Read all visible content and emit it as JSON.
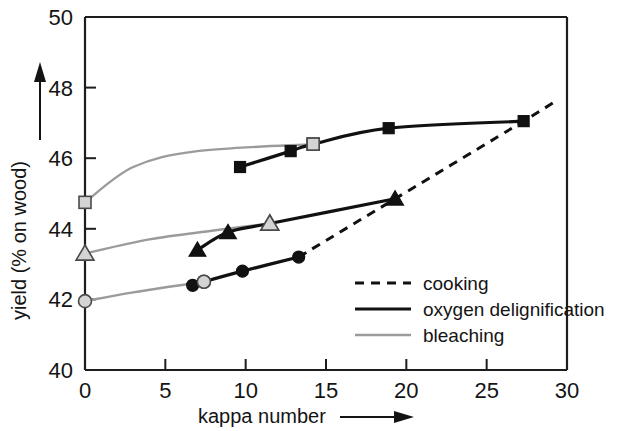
{
  "chart_data": {
    "type": "line",
    "title": "",
    "xlabel": "kappa number",
    "ylabel": "yield (% on wood)",
    "xlim": [
      0,
      30
    ],
    "ylim": [
      40,
      50
    ],
    "xticks": [
      0,
      5,
      10,
      15,
      20,
      25,
      30
    ],
    "yticks": [
      40,
      42,
      44,
      46,
      48,
      50
    ],
    "xtick_labels": [
      "0",
      "5",
      "10",
      "15",
      "20",
      "25",
      "30"
    ],
    "ytick_labels": [
      "40",
      "42",
      "44",
      "46",
      "48",
      "50"
    ],
    "grid": false,
    "legend_position": "inside lower right",
    "series": [
      {
        "name": "cooking",
        "style": "dashed",
        "color": "#111111",
        "points": [
          {
            "x": 13.3,
            "y": 43.2
          },
          {
            "x": 19.3,
            "y": 44.85
          },
          {
            "x": 27.3,
            "y": 47.05
          },
          {
            "x": 29.4,
            "y": 47.65
          }
        ]
      },
      {
        "name": "oxygen delignification",
        "style": "solid",
        "color": "#111111",
        "branches": [
          {
            "label": "upper-squares",
            "marker": "square",
            "points": [
              {
                "x": 9.65,
                "y": 45.75,
                "marker": "filled-square"
              },
              {
                "x": 12.8,
                "y": 46.2,
                "marker": "filled-square"
              },
              {
                "x": 14.2,
                "y": 46.4,
                "marker": "open-square"
              },
              {
                "x": 18.9,
                "y": 46.85,
                "marker": "filled-square"
              },
              {
                "x": 27.3,
                "y": 47.05,
                "marker": "filled-square"
              }
            ]
          },
          {
            "label": "middle-triangles",
            "marker": "triangle",
            "points": [
              {
                "x": 7.0,
                "y": 43.4,
                "marker": "filled-triangle"
              },
              {
                "x": 8.9,
                "y": 43.9,
                "marker": "filled-triangle"
              },
              {
                "x": 11.5,
                "y": 44.15,
                "marker": "open-triangle"
              },
              {
                "x": 19.3,
                "y": 44.85,
                "marker": "filled-triangle"
              }
            ]
          },
          {
            "label": "lower-circles",
            "marker": "circle",
            "points": [
              {
                "x": 6.7,
                "y": 42.4,
                "marker": "filled-circle"
              },
              {
                "x": 7.4,
                "y": 42.5,
                "marker": "open-circle"
              },
              {
                "x": 9.8,
                "y": 42.8,
                "marker": "filled-circle"
              },
              {
                "x": 13.3,
                "y": 43.2,
                "marker": "filled-circle"
              }
            ]
          }
        ]
      },
      {
        "name": "bleaching",
        "style": "solid",
        "color": "#9b9b9b",
        "branches": [
          {
            "label": "upper-squares",
            "points": [
              {
                "x": 0.0,
                "y": 44.75,
                "marker": "open-square"
              },
              {
                "x": 3.0,
                "y": 45.75
              },
              {
                "x": 7.0,
                "y": 46.2
              },
              {
                "x": 14.2,
                "y": 46.4,
                "marker": "open-square"
              }
            ]
          },
          {
            "label": "middle-triangles",
            "points": [
              {
                "x": 0.0,
                "y": 43.3,
                "marker": "open-triangle"
              },
              {
                "x": 4.0,
                "y": 43.7
              },
              {
                "x": 8.0,
                "y": 43.95
              },
              {
                "x": 11.5,
                "y": 44.15,
                "marker": "open-triangle"
              }
            ]
          },
          {
            "label": "lower-circles",
            "points": [
              {
                "x": 0.0,
                "y": 41.95,
                "marker": "open-circle"
              },
              {
                "x": 3.0,
                "y": 42.2
              },
              {
                "x": 7.4,
                "y": 42.5,
                "marker": "open-circle"
              }
            ]
          }
        ]
      }
    ],
    "legend": [
      {
        "label": "cooking",
        "style": "dashed",
        "color": "#111111"
      },
      {
        "label": "oxygen delignification",
        "style": "solid",
        "color": "#111111"
      },
      {
        "label": "bleaching",
        "style": "solid",
        "color": "#9b9b9b"
      }
    ]
  },
  "axes": {
    "x_title": "kappa number",
    "y_title": "yield (% on wood)",
    "x_arrow": "arrow-right",
    "y_arrow": "arrow-up"
  }
}
